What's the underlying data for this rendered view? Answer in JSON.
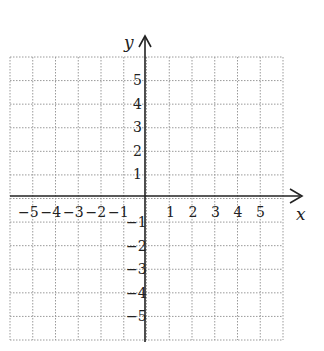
{
  "diagram": {
    "type": "coordinate-grid",
    "x_axis_label": "x",
    "y_axis_label": "y",
    "x_range": [
      -6,
      6
    ],
    "y_range": [
      -6,
      6
    ],
    "grid_style": "dotted",
    "x_ticks": {
      "negative": [
        "−5",
        "−4",
        "−3",
        "−2",
        "−1"
      ],
      "positive": [
        "1",
        "2",
        "3",
        "4",
        "5"
      ]
    },
    "y_ticks": {
      "positive": [
        "5",
        "4",
        "3",
        "2",
        "1"
      ],
      "negative": [
        "−1",
        "−2",
        "−3",
        "−4",
        "−5"
      ]
    },
    "colors": {
      "axis": "#222222",
      "grid": "#9a9a9a",
      "background": "#ffffff"
    }
  }
}
